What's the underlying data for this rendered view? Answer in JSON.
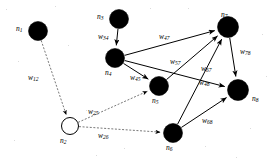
{
  "figure": {
    "type": "directed-weighted-graph"
  },
  "nodes": [
    {
      "id": "n1",
      "label": "n",
      "sub": "1",
      "x": 38,
      "y": 31,
      "r": 9.5,
      "filled": true,
      "label_x": 16,
      "label_y": 25
    },
    {
      "id": "n2",
      "label": "n",
      "sub": "2",
      "x": 70,
      "y": 126,
      "r": 8.5,
      "filled": false,
      "label_x": 60,
      "label_y": 137
    },
    {
      "id": "n3",
      "label": "n",
      "sub": "3",
      "x": 119,
      "y": 19,
      "r": 9.5,
      "filled": true,
      "label_x": 97,
      "label_y": 13
    },
    {
      "id": "n4",
      "label": "n",
      "sub": "4",
      "x": 115,
      "y": 58,
      "r": 9.5,
      "filled": true,
      "label_x": 105,
      "label_y": 69
    },
    {
      "id": "n5",
      "label": "n",
      "sub": "5",
      "x": 159,
      "y": 86,
      "r": 9.5,
      "filled": true,
      "label_x": 152,
      "label_y": 97
    },
    {
      "id": "n6",
      "label": "n",
      "sub": "6",
      "x": 173,
      "y": 133,
      "r": 9.5,
      "filled": true,
      "label_x": 166,
      "label_y": 144
    },
    {
      "id": "n7",
      "label": "n",
      "sub": "7",
      "x": 228,
      "y": 27,
      "r": 10.5,
      "filled": true,
      "label_x": 221,
      "label_y": 11
    },
    {
      "id": "n8",
      "label": "n",
      "sub": "8",
      "x": 238,
      "y": 90,
      "r": 10.5,
      "filled": true,
      "label_x": 252,
      "label_y": 95
    }
  ],
  "edges": [
    {
      "id": "e12",
      "from": "n1",
      "to": "n2",
      "weight": "w",
      "sub": "12",
      "style": "dashed",
      "label_x": 28,
      "label_y": 74
    },
    {
      "id": "e34",
      "from": "n3",
      "to": "n4",
      "weight": "w",
      "sub": "34",
      "style": "solid",
      "label_x": 98,
      "label_y": 33
    },
    {
      "id": "e45",
      "from": "n4",
      "to": "n5",
      "weight": "w",
      "sub": "45",
      "style": "solid",
      "label_x": 130,
      "label_y": 74
    },
    {
      "id": "e47",
      "from": "n4",
      "to": "n7",
      "weight": "w",
      "sub": "47",
      "style": "solid",
      "label_x": 159,
      "label_y": 33
    },
    {
      "id": "e57",
      "from": "n5",
      "to": "n7",
      "weight": "w",
      "sub": "57",
      "style": "solid",
      "label_x": 170,
      "label_y": 58
    },
    {
      "id": "e67",
      "from": "n6",
      "to": "n7",
      "weight": "w",
      "sub": "67",
      "style": "solid",
      "label_x": 201,
      "label_y": 65
    },
    {
      "id": "e78",
      "from": "n7",
      "to": "n8",
      "weight": "w",
      "sub": "78",
      "style": "solid",
      "label_x": 240,
      "label_y": 48
    },
    {
      "id": "e48",
      "from": "n4",
      "to": "n8",
      "weight": "w",
      "sub": "48",
      "style": "solid",
      "label_x": 199,
      "label_y": 79
    },
    {
      "id": "e68",
      "from": "n6",
      "to": "n8",
      "weight": "w",
      "sub": "68",
      "style": "solid",
      "label_x": 202,
      "label_y": 117
    },
    {
      "id": "e25",
      "from": "n2",
      "to": "n5",
      "weight": "w",
      "sub": "25",
      "style": "dashed",
      "label_x": 88,
      "label_y": 108
    },
    {
      "id": "e26",
      "from": "n2",
      "to": "n6",
      "weight": "w",
      "sub": "26",
      "style": "dashed",
      "label_x": 98,
      "label_y": 132
    }
  ],
  "style": {
    "node_fill": "#000000",
    "node_hollow_fill": "#ffffff",
    "node_stroke": "#000000",
    "edge_color": "#000000",
    "dashed_edge_color": "#555555",
    "background": "#ffffff"
  }
}
